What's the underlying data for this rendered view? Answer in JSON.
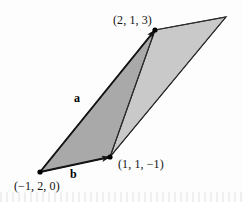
{
  "figure": {
    "background_color": "#fdfdfd",
    "labels": {
      "point_top": "(2, 1, 3)",
      "point_right": "(1, 1, −1)",
      "point_origin": "(−1, 2, 0)",
      "vector_a": "a",
      "vector_b": "b"
    },
    "colors": {
      "fill_dark": "#a9a9a9",
      "fill_light": "#c9c9c9",
      "outline": "#2b2b2b",
      "vector_stroke": "#141414",
      "point_marker": "#000000",
      "text": "#111111"
    },
    "geometry": {
      "points": {
        "origin": [
          40,
          172
        ],
        "b_tip": [
          110,
          157
        ],
        "a_tip": [
          155,
          30
        ],
        "apex": [
          226,
          17
        ]
      },
      "dark_triangle": "40,172 110,157 155,30",
      "light_triangle": "110,157 155,30 226,17",
      "parallelogram": "40,172 110,157 226,17 155,30",
      "vector_a_path": "40,172 155,30",
      "vector_b_path": "40,172 110,157"
    },
    "markers": [
      {
        "name": "vertex-origin",
        "cx": 40,
        "cy": 172,
        "r": 2.6
      },
      {
        "name": "vertex-b-tip",
        "cx": 110,
        "cy": 157,
        "r": 2.6
      },
      {
        "name": "vertex-a-tip",
        "cx": 155,
        "cy": 30,
        "r": 2.6
      }
    ]
  }
}
